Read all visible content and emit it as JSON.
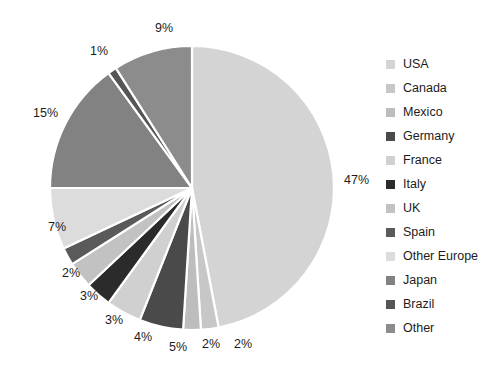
{
  "chart_data": {
    "type": "pie",
    "title": "",
    "labels": [
      "USA",
      "Canada",
      "Mexico",
      "Germany",
      "France",
      "Italy",
      "UK",
      "Spain",
      "Other Europe",
      "Japan",
      "Brazil",
      "Other"
    ],
    "values": [
      47,
      2,
      2,
      5,
      4,
      3,
      3,
      2,
      7,
      15,
      1,
      9
    ],
    "value_labels": [
      "47%",
      "2%",
      "2%",
      "5%",
      "4%",
      "3%",
      "3%",
      "2%",
      "7%",
      "15%",
      "1%",
      "9%"
    ],
    "colors": [
      "#d4d4d4",
      "#c7c7c7",
      "#bdbdbd",
      "#4a4a4a",
      "#d0d0d0",
      "#2b2b2b",
      "#c2c2c2",
      "#5a5a5a",
      "#dcdcdc",
      "#828282",
      "#555555",
      "#8c8c8c"
    ],
    "start_angle": 0,
    "direction": "clockwise",
    "legend_position": "right",
    "grid": false,
    "label_format": "percent",
    "center_x": 192,
    "center_y": 188,
    "radius": 142,
    "separator_color": "#ffffff"
  },
  "legend": {
    "items": [
      {
        "label": "USA",
        "color": "#d4d4d4"
      },
      {
        "label": "Canada",
        "color": "#c7c7c7"
      },
      {
        "label": "Mexico",
        "color": "#bdbdbd"
      },
      {
        "label": "Germany",
        "color": "#4a4a4a"
      },
      {
        "label": "France",
        "color": "#d0d0d0"
      },
      {
        "label": "Italy",
        "color": "#2b2b2b"
      },
      {
        "label": "UK",
        "color": "#c2c2c2"
      },
      {
        "label": "Spain",
        "color": "#5a5a5a"
      },
      {
        "label": "Other Europe",
        "color": "#dcdcdc"
      },
      {
        "label": "Japan",
        "color": "#828282"
      },
      {
        "label": "Brazil",
        "color": "#555555"
      },
      {
        "label": "Other",
        "color": "#8c8c8c"
      }
    ]
  },
  "callout_labels": [
    {
      "text": "47%",
      "x": 344,
      "y": 174
    },
    {
      "text": "2%",
      "x": 234,
      "y": 338
    },
    {
      "text": "2%",
      "x": 202,
      "y": 338
    },
    {
      "text": "5%",
      "x": 169,
      "y": 341
    },
    {
      "text": "4%",
      "x": 134,
      "y": 331
    },
    {
      "text": "3%",
      "x": 105,
      "y": 314
    },
    {
      "text": "3%",
      "x": 80,
      "y": 290
    },
    {
      "text": "2%",
      "x": 62,
      "y": 267
    },
    {
      "text": "7%",
      "x": 48,
      "y": 221
    },
    {
      "text": "15%",
      "x": 33,
      "y": 107
    },
    {
      "text": "1%",
      "x": 90,
      "y": 45
    },
    {
      "text": "9%",
      "x": 155,
      "y": 22
    }
  ]
}
